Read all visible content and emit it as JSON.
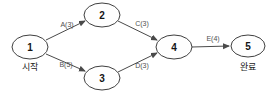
{
  "diagram": {
    "type": "directed-graph",
    "background": "#ffffff",
    "node_stroke": "#3f3f3f",
    "node_fill": "#fefefe",
    "edge_color": "#4a4a4a",
    "node_text_color": "#141414",
    "edge_label_color": "#4f4f4f",
    "sublabel_color": "#1c1c1c",
    "nodes": [
      {
        "id": "1",
        "label": "1",
        "sublabel": "시작",
        "x": 30,
        "y": 47,
        "rx": 18,
        "ry": 12,
        "sublabel_y": 70
      },
      {
        "id": "2",
        "label": "2",
        "sublabel": "",
        "x": 102,
        "y": 15,
        "rx": 18,
        "ry": 12,
        "sublabel_y": 0
      },
      {
        "id": "3",
        "label": "3",
        "sublabel": "",
        "x": 102,
        "y": 78,
        "rx": 18,
        "ry": 12,
        "sublabel_y": 0
      },
      {
        "id": "4",
        "label": "4",
        "sublabel": "",
        "x": 174,
        "y": 47,
        "rx": 18,
        "ry": 12,
        "sublabel_y": 0
      },
      {
        "id": "5",
        "label": "5",
        "sublabel": "완료",
        "x": 248,
        "y": 46,
        "rx": 17,
        "ry": 11,
        "sublabel_y": 70
      }
    ],
    "edges": [
      {
        "id": "A",
        "label": "A(3)",
        "from": "1",
        "to": "2",
        "x1": 46,
        "y1": 40,
        "x2": 85,
        "y2": 21,
        "lx": 67,
        "ly": 27
      },
      {
        "id": "B",
        "label": "B(5)",
        "from": "1",
        "to": "3",
        "x1": 46,
        "y1": 54,
        "x2": 85,
        "y2": 71,
        "lx": 66,
        "ly": 67
      },
      {
        "id": "C",
        "label": "C(3)",
        "from": "2",
        "to": "4",
        "x1": 118,
        "y1": 21,
        "x2": 157,
        "y2": 40,
        "lx": 142,
        "ly": 26
      },
      {
        "id": "D",
        "label": "D(3)",
        "from": "3",
        "to": "4",
        "x1": 118,
        "y1": 72,
        "x2": 157,
        "y2": 53,
        "lx": 142,
        "ly": 68
      },
      {
        "id": "E",
        "label": "E(4)",
        "from": "4",
        "to": "5",
        "x1": 192,
        "y1": 47,
        "x2": 229,
        "y2": 46,
        "lx": 213,
        "ly": 41
      }
    ]
  }
}
